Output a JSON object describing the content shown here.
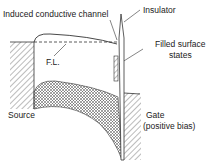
{
  "labels": {
    "channel": "Induced conductive channel",
    "insulator": "Insulator",
    "filled_line1": "Filled surface",
    "filled_line2": "states",
    "fermi": "F.L.",
    "source": "Source",
    "gate_line1": "Gate",
    "gate_line2": "(positive bias)"
  },
  "colors": {
    "line": "#333333",
    "background": "#ffffff"
  }
}
